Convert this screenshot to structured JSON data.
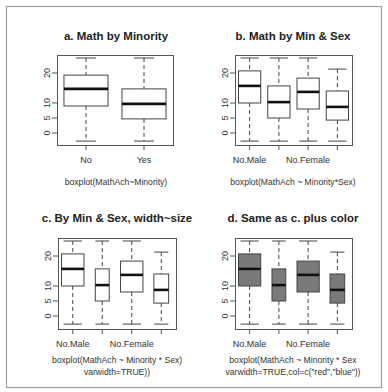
{
  "figure": {
    "border_color": "#a0a0a0",
    "frame_color": "#555555",
    "box_line_color": "#444444",
    "median_color": "#111111",
    "fill_colors": {
      "none": "#ffffff",
      "gray": "#7a7a7a"
    }
  },
  "chart_data": [
    {
      "id": "a",
      "type": "boxplot",
      "title": "a. Math by Minority",
      "caption": [
        "boxplot(MathAch~Minority)"
      ],
      "xlabel": "",
      "ylabel": "",
      "yticks": [
        0,
        5,
        10,
        20
      ],
      "ylim": [
        -3,
        26
      ],
      "x_tick_labels": [
        "No",
        "Yes"
      ],
      "varwidth": false,
      "fill": "none",
      "categories": [
        "No",
        "Yes"
      ],
      "boxes": [
        {
          "category": "No",
          "whisker_low": -2.7,
          "q1": 9.0,
          "median": 14.7,
          "q3": 19.3,
          "whisker_high": 25.0
        },
        {
          "category": "Yes",
          "whisker_low": -2.7,
          "q1": 4.7,
          "median": 9.7,
          "q3": 14.7,
          "whisker_high": 25.0
        }
      ]
    },
    {
      "id": "b",
      "type": "boxplot",
      "title": "b. Math by Min & Sex",
      "caption": [
        "boxplot(MathAch ~ Minority*Sex)"
      ],
      "xlabel": "",
      "ylabel": "",
      "yticks": [
        0,
        5,
        10,
        20
      ],
      "ylim": [
        -3,
        26
      ],
      "x_tick_labels": [
        "No.Male",
        "",
        "No.Female",
        ""
      ],
      "varwidth": false,
      "fill": "none",
      "categories": [
        "No.Male",
        "Yes.Male",
        "No.Female",
        "Yes.Female"
      ],
      "boxes": [
        {
          "category": "No.Male",
          "whisker_low": -2.7,
          "q1": 10.0,
          "median": 15.7,
          "q3": 20.7,
          "whisker_high": 25.0
        },
        {
          "category": "Yes.Male",
          "whisker_low": -2.7,
          "q1": 5.0,
          "median": 10.3,
          "q3": 15.7,
          "whisker_high": 25.0
        },
        {
          "category": "No.Female",
          "whisker_low": -2.7,
          "q1": 8.0,
          "median": 13.7,
          "q3": 18.3,
          "whisker_high": 25.0
        },
        {
          "category": "Yes.Female",
          "whisker_low": -2.7,
          "q1": 4.3,
          "median": 8.7,
          "q3": 14.0,
          "whisker_high": 21.3
        }
      ]
    },
    {
      "id": "c",
      "type": "boxplot",
      "title": "c. By Min & Sex, width~size",
      "caption": [
        "boxplot(MathAch ~ Minority * Sex)",
        "varwidth=TRUE))"
      ],
      "xlabel": "",
      "ylabel": "",
      "yticks": [
        0,
        5,
        10,
        20
      ],
      "ylim": [
        -3,
        26
      ],
      "x_tick_labels": [
        "No.Male",
        "",
        "No.Female",
        ""
      ],
      "varwidth": true,
      "fill": "none",
      "categories": [
        "No.Male",
        "Yes.Male",
        "No.Female",
        "Yes.Female"
      ],
      "boxes": [
        {
          "category": "No.Male",
          "rel_width": 1.0,
          "whisker_low": -2.7,
          "q1": 10.0,
          "median": 15.7,
          "q3": 20.7,
          "whisker_high": 25.0
        },
        {
          "category": "Yes.Male",
          "rel_width": 0.62,
          "whisker_low": -2.7,
          "q1": 5.0,
          "median": 10.3,
          "q3": 15.7,
          "whisker_high": 25.0
        },
        {
          "category": "No.Female",
          "rel_width": 1.0,
          "whisker_low": -2.7,
          "q1": 8.0,
          "median": 13.7,
          "q3": 18.3,
          "whisker_high": 25.0
        },
        {
          "category": "Yes.Female",
          "rel_width": 0.66,
          "whisker_low": -2.7,
          "q1": 4.3,
          "median": 8.7,
          "q3": 14.0,
          "whisker_high": 21.3
        }
      ]
    },
    {
      "id": "d",
      "type": "boxplot",
      "title": "d. Same as c. plus color",
      "caption": [
        "boxplot(MathAch ~ Minority * Sex",
        "varwidth=TRUE,col=c(\"red\",\"blue\"))"
      ],
      "xlabel": "",
      "ylabel": "",
      "yticks": [
        0,
        5,
        10,
        20
      ],
      "ylim": [
        -3,
        26
      ],
      "x_tick_labels": [
        "No.Male",
        "",
        "No.Female",
        ""
      ],
      "varwidth": true,
      "fill": "gray",
      "categories": [
        "No.Male",
        "Yes.Male",
        "No.Female",
        "Yes.Female"
      ],
      "boxes": [
        {
          "category": "No.Male",
          "rel_width": 1.0,
          "whisker_low": -2.7,
          "q1": 10.0,
          "median": 15.7,
          "q3": 20.7,
          "whisker_high": 25.0
        },
        {
          "category": "Yes.Male",
          "rel_width": 0.62,
          "whisker_low": -2.7,
          "q1": 5.0,
          "median": 10.3,
          "q3": 15.7,
          "whisker_high": 25.0
        },
        {
          "category": "No.Female",
          "rel_width": 1.0,
          "whisker_low": -2.7,
          "q1": 8.0,
          "median": 13.7,
          "q3": 18.3,
          "whisker_high": 25.0
        },
        {
          "category": "Yes.Female",
          "rel_width": 0.66,
          "whisker_low": -2.7,
          "q1": 4.3,
          "median": 8.7,
          "q3": 14.0,
          "whisker_high": 21.3
        }
      ]
    }
  ]
}
